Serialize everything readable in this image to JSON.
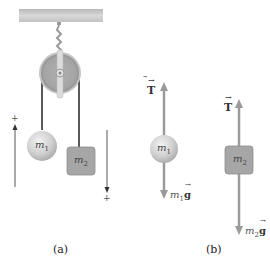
{
  "diagram": {
    "type": "Atwood machine with free-body diagrams",
    "panel_a": {
      "caption": "(a)",
      "mass1_label": "m",
      "mass1_sub": "1",
      "mass2_label": "m",
      "mass2_sub": "2",
      "left_direction_sign": "+",
      "right_direction_sign": "+"
    },
    "panel_b": {
      "caption": "(b)",
      "tension1_label": "T",
      "weight1_label": "m",
      "weight1_sub": "1",
      "weight1_g": "g",
      "mass1_label": "m",
      "mass1_sub": "1",
      "tension2_label": "T",
      "weight2_label": "m",
      "weight2_sub": "2",
      "weight2_g": "g",
      "mass2_label": "m",
      "mass2_sub": "2"
    },
    "colors": {
      "ceiling": "#c8c8c8",
      "pulley": "#a9a9a9",
      "rope": "#222222",
      "sphere": "#d6d6d6",
      "block": "#a6a6a6",
      "force_arrow": "#9a9a9a"
    }
  }
}
